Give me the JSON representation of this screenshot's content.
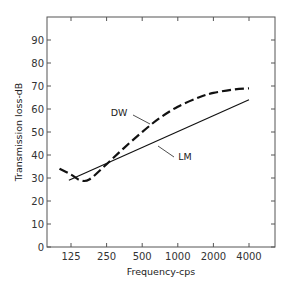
{
  "chart_data": {
    "type": "line",
    "title": "",
    "xlabel": "Frequency-cps",
    "ylabel": "Transmission loss-dB",
    "xscale": "log2",
    "x_ticks": [
      125,
      250,
      500,
      1000,
      2000,
      4000
    ],
    "x_tick_labels": [
      "125",
      "250",
      "500",
      "1000",
      "2000",
      "4000"
    ],
    "y_ticks": [
      0,
      10,
      20,
      30,
      40,
      50,
      60,
      70,
      80,
      90
    ],
    "y_tick_labels": [
      "0",
      "10",
      "20",
      "30",
      "40",
      "50",
      "60",
      "70",
      "80",
      "90"
    ],
    "ylim": [
      0,
      100
    ],
    "xlim": [
      88,
      6000
    ],
    "grid": false,
    "legend": "inline labels",
    "series": [
      {
        "name": "DW",
        "style": "dashed",
        "x": [
          100,
          125,
          150,
          180,
          250,
          350,
          500,
          700,
          1000,
          1500,
          2000,
          3000,
          4000
        ],
        "values": [
          34,
          31.5,
          29,
          29.5,
          36,
          43,
          50,
          56,
          61,
          65,
          67,
          68.5,
          69
        ]
      },
      {
        "name": "LM",
        "style": "solid",
        "x": [
          120,
          4000
        ],
        "values": [
          29,
          64
        ]
      }
    ],
    "annotations": [
      {
        "text": "DW",
        "points_to": "DW curve near 700 cps"
      },
      {
        "text": "LM",
        "points_to": "LM line near 1000 cps"
      }
    ]
  }
}
